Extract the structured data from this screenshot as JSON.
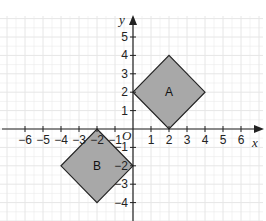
{
  "diagram": {
    "type": "coordinate-grid",
    "axes": {
      "x_label": "x",
      "y_label": "y",
      "origin_label": "O",
      "x_ticks": [
        "−6",
        "−5",
        "−4",
        "−3",
        "−2",
        "−1",
        "1",
        "2",
        "3",
        "4",
        "5",
        "6"
      ],
      "x_tick_values": [
        -6,
        -5,
        -4,
        -3,
        -2,
        -1,
        1,
        2,
        3,
        4,
        5,
        6
      ],
      "y_ticks": [
        "5",
        "4",
        "3",
        "2",
        "1",
        "−1",
        "−2",
        "−3",
        "−4"
      ],
      "y_tick_values": [
        5,
        4,
        3,
        2,
        1,
        -1,
        -2,
        -3,
        -4
      ]
    },
    "shapes": [
      {
        "label": "A",
        "vertices": [
          [
            0,
            2
          ],
          [
            2,
            4
          ],
          [
            4,
            2
          ],
          [
            2,
            0
          ]
        ],
        "fill": "#a8a8a8",
        "stroke": "#222222"
      },
      {
        "label": "B",
        "vertices": [
          [
            -2,
            0
          ],
          [
            0,
            -2
          ],
          [
            -2,
            -4
          ],
          [
            -4,
            -2
          ]
        ],
        "fill": "#a8a8a8",
        "stroke": "#222222"
      }
    ],
    "colors": {
      "grid": "#e6e6e6",
      "axis": "#222222"
    }
  }
}
